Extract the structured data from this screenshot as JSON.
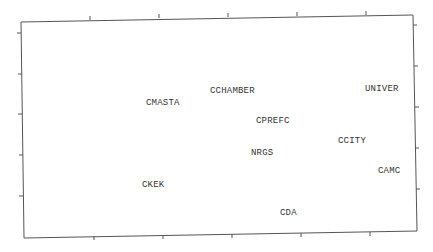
{
  "chart_data": {
    "type": "scatter",
    "title": "",
    "xlabel": "",
    "ylabel": "",
    "grid": false,
    "legend": null,
    "axes": {
      "x_ticks_count": 5,
      "y_ticks_count": 5,
      "tick_labels_shown": false,
      "xlim": [
        0.7,
        6.4
      ],
      "ylim": [
        0.2,
        5.8
      ],
      "y_inverted": true
    },
    "points": [
      {
        "label": "CMASTA",
        "x": 2.0,
        "y": 2.8
      },
      {
        "label": "CCHAMBER",
        "x": 3.1,
        "y": 2.5
      },
      {
        "label": "UNIVER",
        "x": 5.2,
        "y": 2.4
      },
      {
        "label": "CPREFC",
        "x": 3.65,
        "y": 3.2
      },
      {
        "label": "NRGS",
        "x": 3.5,
        "y": 4.0
      },
      {
        "label": "CCITY",
        "x": 4.8,
        "y": 3.7
      },
      {
        "label": "CAMC",
        "x": 5.3,
        "y": 4.5
      },
      {
        "label": "CKEK",
        "x": 1.9,
        "y": 4.8
      },
      {
        "label": "CDA",
        "x": 3.9,
        "y": 5.5
      }
    ]
  },
  "render": {
    "frame": {
      "tl": [
        21,
        22
      ],
      "tr": [
        413,
        15
      ],
      "br": [
        417,
        231
      ],
      "bl": [
        24,
        238
      ]
    },
    "top_ticks": [
      [
        90,
        20
      ],
      [
        159,
        18
      ],
      [
        228,
        17
      ],
      [
        297,
        16
      ],
      [
        366,
        15
      ]
    ],
    "bottom_ticks": [
      [
        94,
        236
      ],
      [
        163,
        235
      ],
      [
        232,
        234
      ],
      [
        301,
        233
      ],
      [
        370,
        232
      ]
    ],
    "left_ticks": [
      [
        21,
        33
      ],
      [
        22,
        74
      ],
      [
        22,
        114
      ],
      [
        23,
        155
      ],
      [
        23,
        196
      ]
    ],
    "right_ticks": [
      [
        413,
        25
      ],
      [
        414,
        66
      ],
      [
        415,
        107
      ],
      [
        415,
        148
      ],
      [
        416,
        189
      ]
    ],
    "labels": [
      {
        "text": "CMASTA",
        "x": 146,
        "y": 105
      },
      {
        "text": "CCHAMBER",
        "x": 210,
        "y": 93
      },
      {
        "text": "UNIVER",
        "x": 365,
        "y": 91
      },
      {
        "text": "CPREFC",
        "x": 256,
        "y": 123
      },
      {
        "text": "NRGS",
        "x": 251,
        "y": 155
      },
      {
        "text": "CCITY",
        "x": 338,
        "y": 143
      },
      {
        "text": "CAMC",
        "x": 378,
        "y": 173
      },
      {
        "text": "CKEK",
        "x": 142,
        "y": 187
      },
      {
        "text": "CDA",
        "x": 280,
        "y": 215
      }
    ],
    "colors": {
      "frame": "#555555",
      "text": "#333333",
      "background": "#ffffff"
    }
  }
}
